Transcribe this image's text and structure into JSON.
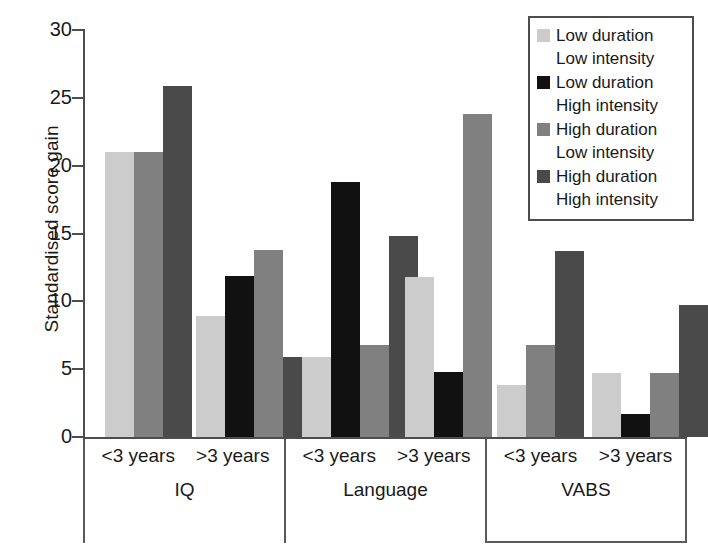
{
  "chart_data": {
    "type": "bar",
    "title": "",
    "xlabel": "",
    "ylabel": "Standardised score gain",
    "ylim": [
      0,
      30
    ],
    "yticks": [
      0,
      5,
      10,
      15,
      20,
      25,
      30
    ],
    "ytick_labels": [
      "0",
      "5",
      "10",
      "15",
      "20",
      "25",
      "30"
    ],
    "grid": false,
    "legend_position": "top-right",
    "groups": [
      "IQ",
      "Language",
      "VABS"
    ],
    "subgroups": [
      "<3 years",
      ">3 years"
    ],
    "categories": [
      "IQ <3 years",
      "IQ >3 years",
      "Language <3 years",
      "Language >3 years",
      "VABS <3 years",
      "VABS >3 years"
    ],
    "series": [
      {
        "name": "Low duration Low intensity",
        "color": "#cccccc",
        "values": [
          21.0,
          8.9,
          5.9,
          11.8,
          3.8,
          4.7
        ]
      },
      {
        "name": "Low duration High intensity",
        "color": "#111111",
        "values": [
          null,
          11.9,
          18.8,
          4.8,
          null,
          1.7
        ]
      },
      {
        "name": "High duration Low intensity",
        "color": "#808080",
        "values": [
          21.0,
          13.8,
          6.8,
          23.8,
          6.8,
          4.7
        ]
      },
      {
        "name": "High duration High intensity",
        "color": "#4a4a4a",
        "values": [
          25.9,
          5.9,
          14.8,
          null,
          13.7,
          9.7
        ]
      }
    ]
  },
  "legend": {
    "entries": [
      {
        "line1": "Low duration",
        "line2": "Low intensity",
        "color": "#cccccc",
        "swatch_name": "legend-swatch-low-duration-low-intensity"
      },
      {
        "line1": "Low duration",
        "line2": "High intensity",
        "color": "#111111",
        "swatch_name": "legend-swatch-low-duration-high-intensity"
      },
      {
        "line1": "High duration",
        "line2": "Low intensity",
        "color": "#808080",
        "swatch_name": "legend-swatch-high-duration-low-intensity"
      },
      {
        "line1": "High duration",
        "line2": "High intensity",
        "color": "#4a4a4a",
        "swatch_name": "legend-swatch-high-duration-high-intensity"
      }
    ]
  },
  "axis": {
    "y_title": "Standardised score gain"
  },
  "colors": {
    "axis": "#4d4d4d",
    "background": "#ffffff",
    "text": "#1a1a1a"
  }
}
